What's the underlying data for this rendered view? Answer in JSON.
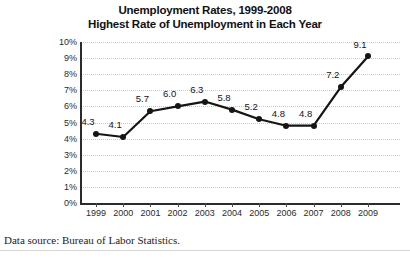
{
  "chart_data": {
    "type": "line",
    "title": "Unemployment Rates, 1999-2008",
    "subtitle": "Highest Rate of Unemployment in Each Year",
    "xlabel": "",
    "ylabel": "",
    "ylim": [
      0,
      10
    ],
    "ytick_step": 1,
    "grid": true,
    "legend": "none",
    "categories": [
      "1999",
      "2000",
      "2001",
      "2002",
      "2003",
      "2004",
      "2005",
      "2006",
      "2007",
      "2008",
      "2009"
    ],
    "values": [
      4.3,
      4.1,
      5.7,
      6.0,
      6.3,
      5.8,
      5.2,
      4.8,
      4.8,
      7.2,
      9.1
    ],
    "point_labels": [
      "4.3",
      "4.1",
      "5.7",
      "6.0",
      "6.3",
      "5.8",
      "5.2",
      "4.8",
      "4.8",
      "7.2",
      "9.1"
    ],
    "ytick_labels": [
      "10%",
      "9%",
      "8%",
      "7%",
      "6%",
      "5%",
      "4%",
      "3%",
      "2%",
      "1%",
      "0%"
    ],
    "series_color": "#151515",
    "grid_color": "#c9c9c9",
    "axis_color": "#2b2b2b"
  },
  "footer": {
    "source_note": "Data source: Bureau of Labor Statistics."
  }
}
